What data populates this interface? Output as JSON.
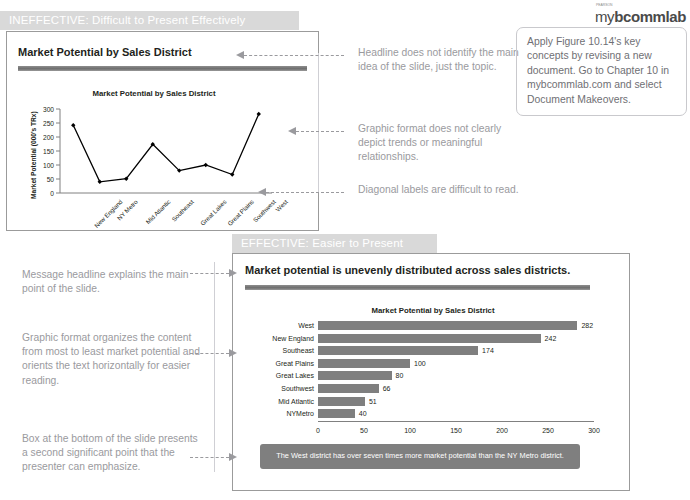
{
  "sections": {
    "ineffective": {
      "banner": "INEFFECTIVE: Difficult to Present Effectively",
      "slide_title": "Market Potential by Sales District",
      "notes": [
        "Headline does not identify the main idea of the slide, just the topic.",
        "Graphic format does not clearly depict trends or meaningful relationships.",
        "Diagonal labels are difficult to read."
      ]
    },
    "effective": {
      "banner": "EFFECTIVE: Easier to Present",
      "slide_title": "Market potential is unevenly distributed across sales districts.",
      "callout": "The West district has over seven times more market potential than the NY Metro district.",
      "notes": [
        "Message headline explains the main point of the slide.",
        "Graphic format organizes the content from most to least market potential and orients the text horizontally for easier reading.",
        "Box at the bottom of the slide presents a second significant point that the presenter can emphasize."
      ]
    }
  },
  "mybcommlab": {
    "logo_sup": "PEARSON",
    "logo_my": "my",
    "logo_rest": "bcommlab",
    "body": "Apply Figure 10.14's key concepts by revising a new document. Go to Chapter 10 in mybcommlab.com and select Document Makeovers."
  },
  "chart_data": [
    {
      "type": "line",
      "title": "Market Potential by Sales District",
      "xlabel": "",
      "ylabel": "Market Potential (000's TRx)",
      "categories": [
        "New England",
        "NY Metro",
        "Mid Atlantic",
        "Southeast",
        "Great Lakes",
        "Great Plains",
        "Southwest",
        "West"
      ],
      "values": [
        242,
        40,
        51,
        174,
        80,
        100,
        66,
        282
      ],
      "yticks": [
        0,
        50,
        100,
        150,
        200,
        250,
        300
      ],
      "ylim": [
        0,
        300
      ],
      "grid": false,
      "legend": "none"
    },
    {
      "type": "bar",
      "orientation": "horizontal",
      "title": "Market Potential by Sales District",
      "xlabel": "Market Potential (000's TRx)",
      "ylabel": "",
      "categories": [
        "West",
        "New England",
        "Southeast",
        "Great Plains",
        "Great Lakes",
        "Southwest",
        "Mid Atlantic",
        "NYMetro"
      ],
      "values": [
        282,
        242,
        174,
        100,
        80,
        66,
        51,
        40
      ],
      "xticks": [
        0,
        50,
        100,
        150,
        200,
        250,
        300
      ],
      "xlim": [
        0,
        300
      ],
      "grid": false,
      "legend": "none",
      "bar_color": "#7f7f7f"
    }
  ]
}
